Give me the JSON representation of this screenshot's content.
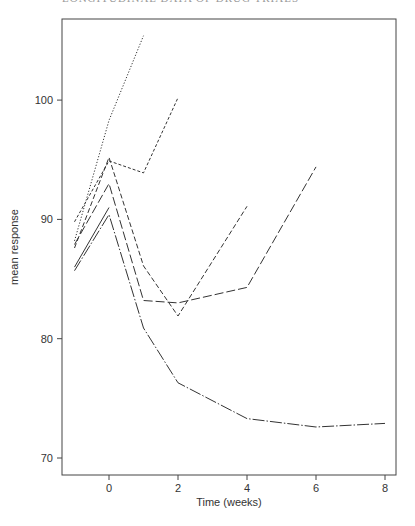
{
  "page": {
    "header_text": "LONGITUDINAL DATA OF DRUG TRIALS"
  },
  "chart_data": {
    "type": "line",
    "title": "",
    "xlabel": "Time (weeks)",
    "ylabel": "mean response",
    "xlim": [
      -1.4,
      8.3
    ],
    "ylim": [
      68.5,
      107
    ],
    "xticks": [
      0,
      2,
      4,
      6,
      8
    ],
    "yticks": [
      70,
      80,
      90,
      100
    ],
    "grid": false,
    "legend": null,
    "series": [
      {
        "name": "series-1",
        "style": "dotted",
        "x": [
          -1,
          0,
          1
        ],
        "y": [
          88.2,
          98.3,
          105.4
        ]
      },
      {
        "name": "series-2",
        "style": "short-dash",
        "x": [
          -1,
          0,
          1,
          2
        ],
        "y": [
          89.8,
          94.9,
          93.9,
          100.2
        ]
      },
      {
        "name": "series-3",
        "style": "dash",
        "x": [
          -1,
          0,
          1,
          2,
          4
        ],
        "y": [
          87.6,
          95.2,
          86.1,
          81.9,
          91.1
        ]
      },
      {
        "name": "series-4",
        "style": "long-dash",
        "x": [
          -1,
          0,
          1,
          2,
          4,
          6
        ],
        "y": [
          87.9,
          93.0,
          83.2,
          83.0,
          84.3,
          94.4
        ]
      },
      {
        "name": "series-5",
        "style": "solid",
        "x": [
          -1,
          0
        ],
        "y": [
          86.0,
          91.0
        ]
      },
      {
        "name": "series-6",
        "style": "long-dash-dot",
        "x": [
          -1,
          0,
          1,
          2,
          4,
          6,
          8
        ],
        "y": [
          85.7,
          90.4,
          80.9,
          76.3,
          73.3,
          72.6,
          72.9
        ]
      }
    ]
  }
}
